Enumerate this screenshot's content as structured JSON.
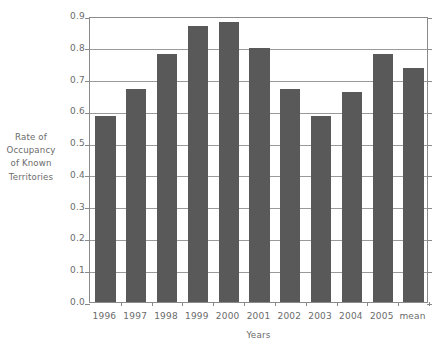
{
  "chart_data": {
    "type": "bar",
    "title": "",
    "xlabel": "Years",
    "ylabel_lines": [
      "Rate of",
      "Occupancy",
      "of Known",
      "Territories"
    ],
    "ylabel": "Rate of Occupancy of Known Territories",
    "categories": [
      "1996",
      "1997",
      "1998",
      "1999",
      "2000",
      "2001",
      "2002",
      "2003",
      "2004",
      "2005",
      "mean"
    ],
    "values": [
      0.585,
      0.67,
      0.78,
      0.87,
      0.88,
      0.8,
      0.67,
      0.585,
      0.66,
      0.78,
      0.735
    ],
    "ylim": [
      0.0,
      0.9
    ],
    "ytick_labels": [
      "0.0",
      "0.1",
      "0.2",
      "0.3",
      "0.4",
      "0.5",
      "0.6",
      "0.7",
      "0.8",
      "0.9"
    ],
    "ytick_values": [
      0.0,
      0.1,
      0.2,
      0.3,
      0.4,
      0.5,
      0.6,
      0.7,
      0.8,
      0.9
    ],
    "grid": true,
    "legend": null,
    "bar_color": "#595959",
    "axis_color": "#8a8a8a",
    "grid_color": "#9a9a9a",
    "text_color": "#6b6b6b",
    "background": "#ffffff"
  }
}
